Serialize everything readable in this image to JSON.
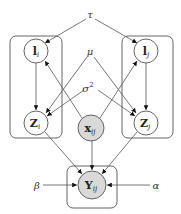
{
  "diagram": {
    "type": "graphical-model",
    "colors": {
      "observed_fill": "#d9d9d9",
      "latent_fill": "#ffffff",
      "stroke": "#555555",
      "text": "#222222"
    },
    "parameters": {
      "tau": "τ",
      "mu": "μ",
      "sigma2": "σ",
      "sigma2_exp": "2",
      "beta": "β",
      "alpha": "α"
    },
    "nodes": {
      "l_i": {
        "main": "l",
        "sub": "i",
        "observed": false
      },
      "z_i": {
        "main": "Z",
        "sub": "i",
        "observed": false
      },
      "l_j": {
        "main": "l",
        "sub": "j",
        "observed": false
      },
      "z_j": {
        "main": "Z",
        "sub": "j",
        "observed": false
      },
      "x_ij": {
        "main": "x",
        "sub": "ij",
        "observed": true
      },
      "y_ij": {
        "main": "Y",
        "sub": "ij",
        "observed": true
      }
    },
    "plates": [
      "plate-i",
      "plate-j",
      "plate-ij"
    ],
    "edges": [
      [
        "τ",
        "l_i"
      ],
      [
        "τ",
        "l_j"
      ],
      [
        "l_i",
        "Z_i"
      ],
      [
        "l_j",
        "Z_j"
      ],
      [
        "μ",
        "Z_i"
      ],
      [
        "μ",
        "Z_j"
      ],
      [
        "σ²",
        "Z_i"
      ],
      [
        "σ²",
        "Z_j"
      ],
      [
        "x_ij",
        "l_i"
      ],
      [
        "x_ij",
        "l_j"
      ],
      [
        "Z_i",
        "Y_ij"
      ],
      [
        "Z_j",
        "Y_ij"
      ],
      [
        "x_ij",
        "Y_ij"
      ],
      [
        "β",
        "Y_ij"
      ],
      [
        "α",
        "Y_ij"
      ]
    ]
  }
}
